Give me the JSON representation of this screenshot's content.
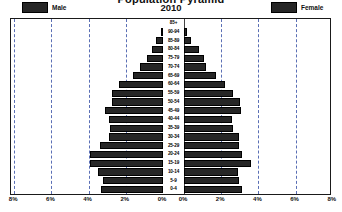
{
  "header": {
    "title": "Population Pyramid",
    "year": "2010",
    "legend": [
      {
        "label": "Male",
        "color": "#262626",
        "name": "legend-male"
      },
      {
        "label": "Female",
        "color": "#262626",
        "name": "legend-female"
      }
    ]
  },
  "axis": {
    "x_ticks": [
      "8%",
      "6%",
      "4%",
      "2%",
      "0%",
      "0%",
      "2%",
      "4%",
      "6%",
      "8%"
    ]
  },
  "chart_data": {
    "type": "bar",
    "subtype": "population-pyramid",
    "title": "Population Pyramid",
    "subtitle": "2010",
    "xlabel": "",
    "ylabel": "",
    "xlim": [
      0,
      8
    ],
    "x_tick_values": [
      8,
      6,
      4,
      2,
      0,
      0,
      2,
      4,
      6,
      8
    ],
    "x_tick_labels": [
      "8%",
      "6%",
      "4%",
      "2%",
      "0%",
      "0%",
      "2%",
      "4%",
      "6%",
      "8%"
    ],
    "grid": true,
    "grid_style": "dashed",
    "grid_color": "#5a6fb5",
    "legend_position": "top",
    "categories": [
      "85+",
      "90-94",
      "85-89",
      "80-84",
      "75-79",
      "70-74",
      "65-69",
      "60-64",
      "55-59",
      "50-54",
      "45-49",
      "40-44",
      "35-39",
      "30-34",
      "25-29",
      "20-24",
      "15-19",
      "10-14",
      "5-9",
      "0-4"
    ],
    "series": [
      {
        "name": "Male",
        "color": "#262626",
        "side": "left",
        "values": [
          0.0,
          0.1,
          0.35,
          0.6,
          0.85,
          1.25,
          1.6,
          2.35,
          2.75,
          2.75,
          3.1,
          2.9,
          2.85,
          2.9,
          3.4,
          3.9,
          3.9,
          3.5,
          3.25,
          3.35
        ]
      },
      {
        "name": "Female",
        "color": "#262626",
        "side": "right",
        "values": [
          0.0,
          0.15,
          0.4,
          0.8,
          1.1,
          1.2,
          1.7,
          2.2,
          2.65,
          3.0,
          3.05,
          2.6,
          2.65,
          2.95,
          2.95,
          3.1,
          3.6,
          2.9,
          2.95,
          3.1
        ]
      }
    ]
  }
}
